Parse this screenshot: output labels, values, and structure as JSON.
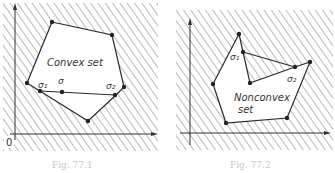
{
  "figures": [
    {
      "id": "left",
      "title": "Convex set",
      "caption": "Fig. 77.1",
      "origin_label": "0",
      "points": {
        "sigma1": "σ₁",
        "sigma": "σ",
        "sigma2": "σ₂"
      },
      "line_color": "#2a2a2a",
      "hatch_color": "#555555"
    },
    {
      "id": "right",
      "title_line1": "Nonconvex",
      "title_line2": "set",
      "caption": "Fig. 77.2",
      "points": {
        "sigma1": "σ₁",
        "sigma2": "σ₂"
      },
      "line_color": "#2a2a2a",
      "hatch_color": "#555555"
    }
  ]
}
